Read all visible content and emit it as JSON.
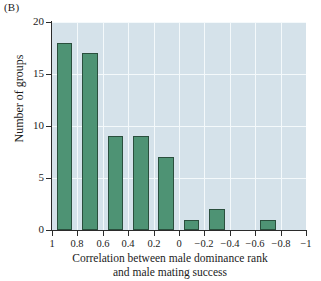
{
  "panel": {
    "label": "(B)"
  },
  "chart_data": {
    "type": "bar",
    "title": "",
    "subtitle": "",
    "xlabel": "Correlation between male dominance rank and male mating success",
    "xlabel_lines": [
      "Correlation between male dominance rank",
      "and male mating success"
    ],
    "ylabel": "Number of groups",
    "categories": [
      "1 to 0.8",
      "0.8 to 0.6",
      "0.6 to 0.4",
      "0.4 to 0.2",
      "0.2 to 0",
      "0 to -0.2",
      "-0.2 to -0.4",
      "-0.4 to -0.6",
      "-0.6 to -0.8",
      "-0.8 to -1"
    ],
    "bin_edges": [
      1,
      0.8,
      0.6,
      0.4,
      0.2,
      0,
      -0.2,
      -0.4,
      -0.6,
      -0.8,
      -1
    ],
    "values": [
      18,
      17,
      9,
      9,
      7,
      1,
      2,
      0,
      1,
      0
    ],
    "xlim": [
      1,
      -1
    ],
    "ylim": [
      0,
      20
    ],
    "x_ticks": [
      1,
      0.8,
      0.6,
      0.4,
      0.2,
      0,
      -0.2,
      -0.4,
      -0.6,
      -0.8,
      -1
    ],
    "x_ticklabels": [
      "1",
      "0.8",
      "0.6",
      "0.4",
      "0.2",
      "0",
      "−0.2",
      "−0.4",
      "−0.6",
      "−0.8",
      "−1"
    ],
    "y_ticks": [
      0,
      5,
      10,
      15,
      20
    ],
    "y_ticklabels": [
      "0",
      "5",
      "10",
      "15",
      "20"
    ],
    "grid": true,
    "legend": null,
    "bar_color": "#4e9374",
    "bar_edge_color": "#2a4f3d",
    "plot_background": "#d5e2ea",
    "gridline_color": "#f4f9fb",
    "axis_color": "#2b2b2b"
  }
}
